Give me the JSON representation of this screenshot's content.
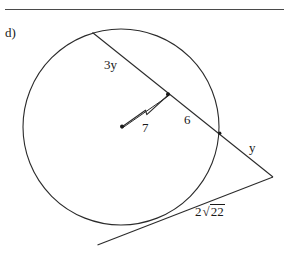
{
  "document": {
    "part_label": "d)",
    "has_top_rule": true,
    "background_color": "#ffffff",
    "ink_color": "#1a1a1a",
    "rule_color": "#4a4a4a"
  },
  "figure": {
    "type": "circle-secant-tangent-geometry-diagram",
    "circle": {
      "center_x": 121,
      "center_y": 127,
      "radius": 98,
      "stroke_color": "#2b2b2b"
    },
    "points": {
      "center_dot": {
        "x": 122,
        "y": 126
      },
      "chord_midpoint_dot": {
        "x": 168,
        "y": 94
      },
      "secant_entry": {
        "x": 93,
        "y": 33
      },
      "secant_exit_dot": {
        "x": 220,
        "y": 133
      },
      "external_vertex": {
        "x": 273,
        "y": 177
      },
      "tangent_point": {
        "x": 168,
        "y": 218
      },
      "tangent_tail": {
        "x": 98,
        "y": 245
      }
    },
    "segments": [
      {
        "name": "secant-line",
        "from": "secant_entry",
        "to": "external_vertex"
      },
      {
        "name": "radius-perpendicular-marker",
        "from": "center_dot",
        "to": "chord_midpoint_dot"
      },
      {
        "name": "tangent-line",
        "from": "tangent_tail",
        "to": "external_vertex"
      }
    ]
  },
  "labels": {
    "chord_far": "3y",
    "radius": "7",
    "chord_near": "6",
    "external_secant": "y",
    "tangent_coefficient": "2",
    "tangent_radicand": "22"
  }
}
